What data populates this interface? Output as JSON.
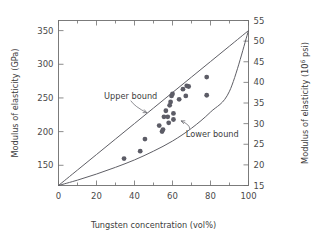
{
  "chart_data": {
    "type": "scatter",
    "title": "",
    "xlabel": "Tungsten concentration (vol%)",
    "ylabel": "Modulus of elasticity (GPa)",
    "ylabel_right": "Modulus of elasticity (10⁶ psi)",
    "ylabel_right_base": "Modulus of elasticity (10",
    "ylabel_right_exp": "6",
    "ylabel_right_tail": " psi)",
    "xlim": [
      0,
      100
    ],
    "ylim": [
      120,
      365
    ],
    "ylim_right": [
      15,
      55
    ],
    "grid": false,
    "legend_position": "inline-annotations",
    "xticks": [
      0,
      20,
      40,
      60,
      80,
      100
    ],
    "xtick_labels": [
      "0",
      "20",
      "40",
      "60",
      "80",
      "100"
    ],
    "x_minor_ticks": [
      10,
      30,
      50,
      70,
      90
    ],
    "yticks_left": [
      150,
      200,
      250,
      300,
      350
    ],
    "ytick_labels_left": [
      "150",
      "200",
      "250",
      "300",
      "350"
    ],
    "yticks_right": [
      15,
      20,
      25,
      30,
      35,
      40,
      45,
      50,
      55
    ],
    "ytick_labels_right": [
      "15",
      "20",
      "25",
      "30",
      "35",
      "40",
      "45",
      "50",
      "55"
    ],
    "annotations": [
      {
        "name": "upper-bound",
        "text": "Upper bound",
        "text_x": 24,
        "text_y": 253,
        "leader_from": [
          38,
          246
        ],
        "leader_to": [
          46.5,
          228
        ]
      },
      {
        "name": "lower-bound",
        "text": "Lower bound",
        "text_x": 67,
        "text_y": 197,
        "leader_from": [
          69,
          204
        ],
        "leader_to": [
          64.5,
          216
        ]
      }
    ],
    "series": [
      {
        "name": "Upper bound",
        "type": "curve",
        "note": "Rule-of-mixtures upper (Voigt) bound, linear from 120 GPa at 0 vol% to 350 GPa at 100 vol%",
        "points": [
          [
            0,
            120
          ],
          [
            10,
            143
          ],
          [
            20,
            166
          ],
          [
            30,
            189
          ],
          [
            40,
            212
          ],
          [
            50,
            235
          ],
          [
            60,
            258
          ],
          [
            70,
            281
          ],
          [
            80,
            304
          ],
          [
            90,
            327
          ],
          [
            100,
            350
          ]
        ]
      },
      {
        "name": "Lower bound",
        "type": "curve",
        "note": "Rule-of-mixtures lower (Reuss) bound, harmonic mean between 120 GPa and 350 GPa",
        "points": [
          [
            0,
            120
          ],
          [
            10,
            128
          ],
          [
            20,
            137
          ],
          [
            30,
            147
          ],
          [
            40,
            158
          ],
          [
            50,
            171
          ],
          [
            60,
            186
          ],
          [
            70,
            205
          ],
          [
            80,
            229
          ],
          [
            90,
            260
          ],
          [
            100,
            350
          ]
        ]
      },
      {
        "name": "Experimental data",
        "type": "scatter",
        "points": [
          [
            34.5,
            160
          ],
          [
            43.0,
            171
          ],
          [
            45.5,
            189
          ],
          [
            53.0,
            209
          ],
          [
            54.5,
            200
          ],
          [
            55.0,
            203
          ],
          [
            55.5,
            222
          ],
          [
            56.5,
            231
          ],
          [
            57.5,
            222
          ],
          [
            58.0,
            213
          ],
          [
            58.5,
            239
          ],
          [
            59.0,
            244
          ],
          [
            59.5,
            253
          ],
          [
            60.0,
            256
          ],
          [
            60.5,
            227
          ],
          [
            60.5,
            218
          ],
          [
            63.5,
            248
          ],
          [
            65.5,
            263
          ],
          [
            67.0,
            253
          ],
          [
            67.5,
            268
          ],
          [
            68.5,
            267
          ],
          [
            78.0,
            281
          ],
          [
            78.0,
            254
          ]
        ]
      }
    ]
  },
  "figure": {
    "background_color": "#ffffff",
    "axis_color": "#6e6e6e",
    "curve_color": "#5f5f66",
    "point_color": "#5c5c66",
    "text_color": "#3d3d3d"
  }
}
